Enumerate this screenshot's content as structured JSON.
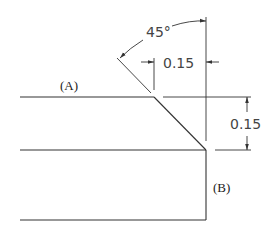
{
  "diagram": {
    "type": "chamfer-dimension-drawing",
    "labels": {
      "edge_a": "(A)",
      "edge_b": "(B)",
      "angle": "45°",
      "horizontal_dim": "0.15",
      "vertical_dim": "0.15"
    },
    "colors": {
      "line": "#333333",
      "text": "#222222",
      "dim_text": "#444444",
      "background": "#ffffff"
    }
  }
}
